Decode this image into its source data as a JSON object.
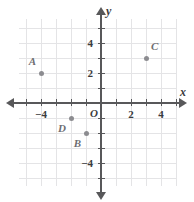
{
  "chart_data": {
    "type": "scatter",
    "title": "",
    "xlabel": "x",
    "ylabel": "y",
    "xlim": [
      -5.5,
      5
    ],
    "ylim": [
      -5.5,
      5.5
    ],
    "grid": true,
    "origin_label": "O",
    "xticks": [
      -5,
      -4,
      -3,
      -2,
      -1,
      1,
      2,
      3,
      4,
      5
    ],
    "yticks": [
      -5,
      -4,
      -3,
      -2,
      -1,
      1,
      2,
      3,
      4,
      5
    ],
    "xtick_labels": [
      {
        "value": -4,
        "text": "−4"
      },
      {
        "value": 2,
        "text": "2"
      },
      {
        "value": 4,
        "text": "4"
      }
    ],
    "ytick_labels": [
      {
        "value": 4,
        "text": "4"
      },
      {
        "value": 2,
        "text": "2"
      },
      {
        "value": -4,
        "text": "−4"
      }
    ],
    "points": [
      {
        "label": "A",
        "x": -4,
        "y": 2,
        "label_pos": "upper-left"
      },
      {
        "label": "B",
        "x": -1,
        "y": -2,
        "label_pos": "lower-left"
      },
      {
        "label": "C",
        "x": 3,
        "y": 3,
        "label_pos": "upper-right"
      },
      {
        "label": "D",
        "x": -2,
        "y": -1,
        "label_pos": "lower-left"
      }
    ],
    "colors": {
      "axis": "#58585a",
      "grid": "#e4e4e6",
      "point": "#8c8c90",
      "label": "#6e6e72",
      "background": "#ffffff"
    }
  }
}
